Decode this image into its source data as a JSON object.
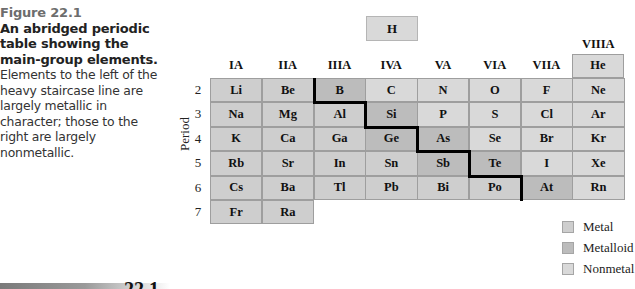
{
  "caption": {
    "figure_number": "Figure 22.1",
    "title": "An abridged periodic table showing the main-group elements.",
    "body": "Elements to the left of the heavy staircase line are largely metallic in character; those to the right are largely nonmetallic."
  },
  "table": {
    "hydrogen": "H",
    "groups": [
      "IA",
      "IIA",
      "IIIA",
      "IVA",
      "VA",
      "VIA",
      "VIIA",
      "VIIIA"
    ],
    "period_axis_label": "Period",
    "periods": [
      "2",
      "3",
      "4",
      "5",
      "6",
      "7"
    ],
    "helium": "He",
    "rows": [
      [
        {
          "s": "Li",
          "t": "metal"
        },
        {
          "s": "Be",
          "t": "metal"
        },
        {
          "s": "B",
          "t": "metalloid"
        },
        {
          "s": "C",
          "t": "nonmetal"
        },
        {
          "s": "N",
          "t": "nonmetal"
        },
        {
          "s": "O",
          "t": "nonmetal"
        },
        {
          "s": "F",
          "t": "nonmetal"
        },
        {
          "s": "Ne",
          "t": "nonmetal"
        }
      ],
      [
        {
          "s": "Na",
          "t": "metal"
        },
        {
          "s": "Mg",
          "t": "metal"
        },
        {
          "s": "Al",
          "t": "metal"
        },
        {
          "s": "Si",
          "t": "metalloid"
        },
        {
          "s": "P",
          "t": "nonmetal"
        },
        {
          "s": "S",
          "t": "nonmetal"
        },
        {
          "s": "Cl",
          "t": "nonmetal"
        },
        {
          "s": "Ar",
          "t": "nonmetal"
        }
      ],
      [
        {
          "s": "K",
          "t": "metal"
        },
        {
          "s": "Ca",
          "t": "metal"
        },
        {
          "s": "Ga",
          "t": "metal"
        },
        {
          "s": "Ge",
          "t": "metalloid"
        },
        {
          "s": "As",
          "t": "metalloid"
        },
        {
          "s": "Se",
          "t": "nonmetal"
        },
        {
          "s": "Br",
          "t": "nonmetal"
        },
        {
          "s": "Kr",
          "t": "nonmetal"
        }
      ],
      [
        {
          "s": "Rb",
          "t": "metal"
        },
        {
          "s": "Sr",
          "t": "metal"
        },
        {
          "s": "In",
          "t": "metal"
        },
        {
          "s": "Sn",
          "t": "metal"
        },
        {
          "s": "Sb",
          "t": "metalloid"
        },
        {
          "s": "Te",
          "t": "metalloid"
        },
        {
          "s": "I",
          "t": "nonmetal"
        },
        {
          "s": "Xe",
          "t": "nonmetal"
        }
      ],
      [
        {
          "s": "Cs",
          "t": "metal"
        },
        {
          "s": "Ba",
          "t": "metal"
        },
        {
          "s": "Tl",
          "t": "metal"
        },
        {
          "s": "Pb",
          "t": "metal"
        },
        {
          "s": "Bi",
          "t": "metal"
        },
        {
          "s": "Po",
          "t": "metal"
        },
        {
          "s": "At",
          "t": "metalloid"
        },
        {
          "s": "Rn",
          "t": "nonmetal"
        }
      ],
      [
        {
          "s": "Fr",
          "t": "metal"
        },
        {
          "s": "Ra",
          "t": "metal"
        }
      ]
    ]
  },
  "legend": [
    {
      "label": "Metal",
      "color": "#cecece"
    },
    {
      "label": "Metalloid",
      "color": "#bcbcbc"
    },
    {
      "label": "Nonmetal",
      "color": "#d9d9d9"
    }
  ],
  "footer": {
    "section_number_partial": "22.1"
  }
}
